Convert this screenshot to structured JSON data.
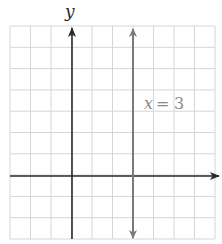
{
  "figure": {
    "axis_labels": {
      "y": "y"
    },
    "line_label": "x = 3",
    "line_label_parts": {
      "var": "x",
      "eq": "=",
      "num": "3"
    },
    "colors": {
      "grid": "#d6d6d6",
      "axis": "#2a2a2a",
      "line": "#7a7a7a",
      "label": "#8a8a8a",
      "background": "#ffffff"
    }
  },
  "chart_data": {
    "type": "line",
    "title": "",
    "xlabel": "",
    "ylabel": "y",
    "xlim": [
      -3,
      7
    ],
    "ylim": [
      -3,
      7
    ],
    "grid": true,
    "series": [
      {
        "name": "x = 3",
        "kind": "vertical-line",
        "x": [
          3,
          3
        ],
        "y": [
          -3,
          7
        ]
      }
    ],
    "annotations": [
      {
        "text": "x = 3",
        "x": 3.3,
        "y": 3.2
      }
    ]
  }
}
